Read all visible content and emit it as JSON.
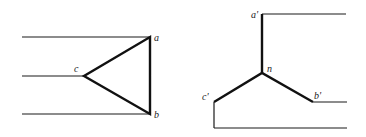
{
  "diagram": {
    "type": "circuit-connection-diagram",
    "left": {
      "name": "delta-connection",
      "labels": {
        "a": "a",
        "b": "b",
        "c": "c"
      }
    },
    "right": {
      "name": "wye-connection",
      "labels": {
        "a": "a'",
        "b": "b'",
        "c": "c'",
        "n": "n"
      }
    },
    "colors": {
      "line": "#111111",
      "background": "#ffffff",
      "label": "#222222"
    }
  }
}
